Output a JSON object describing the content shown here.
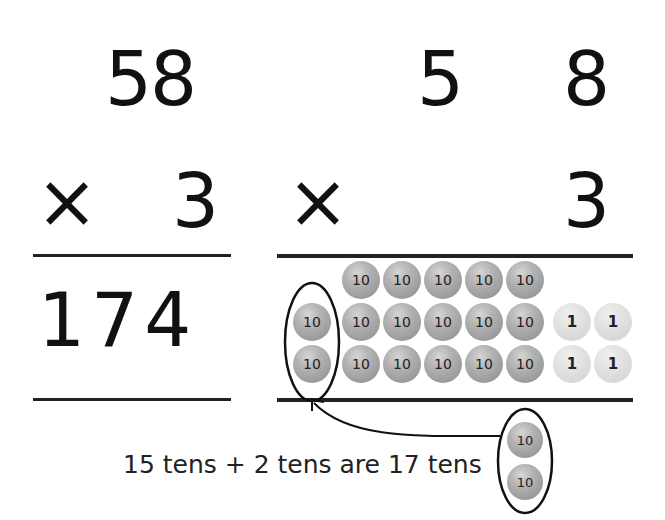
{
  "left_column": {
    "multiplicand": "58",
    "operator": "×",
    "multiplier": "3",
    "product": "174"
  },
  "right_column": {
    "multiplicand_tens": "5",
    "multiplicand_ones": "8",
    "operator": "×",
    "multiplier": "3"
  },
  "place_value_counters": {
    "ten_label": "10",
    "one_label": "1",
    "rows": [
      {
        "tens": 5,
        "ones": 0
      },
      {
        "tens": 6,
        "ones": 2
      },
      {
        "tens": 6,
        "ones": 2
      }
    ],
    "circled_group_left": [
      "10",
      "10"
    ],
    "circled_group_bottom": [
      "10",
      "10"
    ]
  },
  "caption": "15 tens + 2 tens are 17 tens",
  "colors": {
    "ten_counter": "#a6a6a6",
    "one_counter": "#dcdcdc",
    "ink": "#111111"
  }
}
